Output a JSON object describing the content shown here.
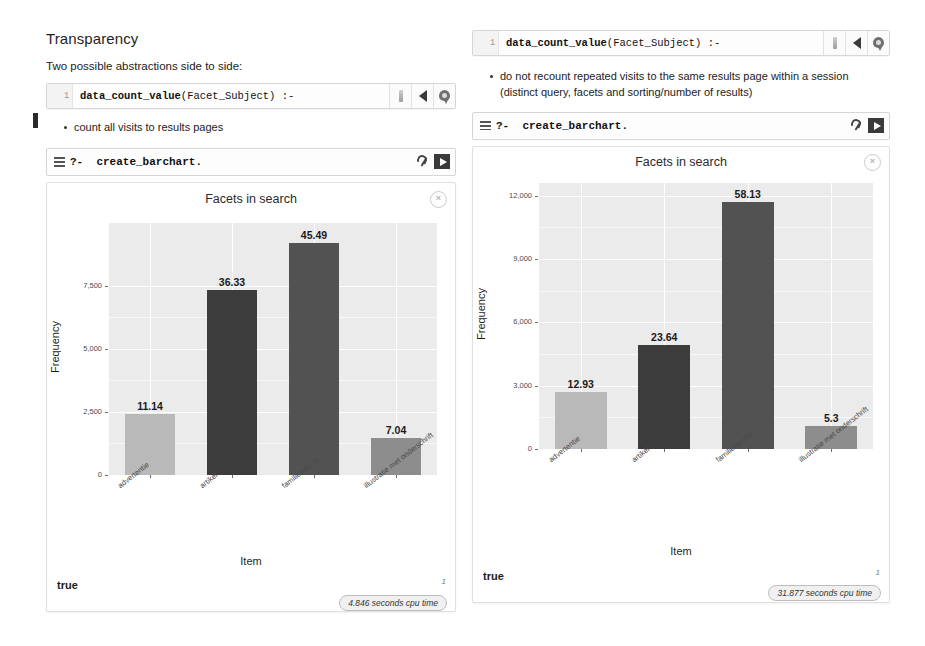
{
  "slide": {
    "title": "Transparency",
    "subtitle": "Two possible abstractions side to side:"
  },
  "left_panel": {
    "code_line_no": "1",
    "code_bold": "data_count_value",
    "code_rest": "(Facet_Subject) :-",
    "bullet": "count all visits to results pages",
    "query_prompt": "?-",
    "query_text": "create_barchart.",
    "close_label": "×",
    "result": "true",
    "page_number": "1",
    "cpu_badge": "4.846 seconds cpu time",
    "icons": {
      "slider": "slider-icon",
      "back": "triangle-left-icon",
      "pin": "location-pin-icon",
      "menu": "hamburger-icon",
      "wrench": "wrench-icon",
      "run": "play-icon"
    }
  },
  "right_panel": {
    "code_line_no": "1",
    "code_bold": "data_count_value",
    "code_rest": "(Facet_Subject) :-",
    "bullet": "do not recount repeated visits to the same results page within a session (distinct query, facets and sorting/number of results)",
    "query_prompt": "?-",
    "query_text": "create_barchart.",
    "close_label": "×",
    "result": "true",
    "page_number": "1",
    "cpu_badge": "31.877 seconds cpu time"
  },
  "chart_data": [
    {
      "id": "left",
      "type": "bar",
      "title": "Facets in search",
      "xlabel": "Item",
      "ylabel": "Frequency",
      "categories": [
        "advertentie",
        "artikel",
        "familiebericht",
        "illustratie met onderschrift"
      ],
      "values": [
        2400,
        7350,
        9200,
        1450
      ],
      "data_labels": [
        "11.14",
        "36.33",
        "45.49",
        "7.04"
      ],
      "bar_colors": [
        "#b9b9b9",
        "#3c3c3c",
        "#525252",
        "#8d8d8d"
      ],
      "yticks": [
        0,
        2500,
        5000,
        7500
      ],
      "ytick_labels": [
        "0",
        "2,500",
        "5,000",
        "7,500"
      ],
      "ylim": [
        0,
        10000
      ],
      "grid": true,
      "legend": "none"
    },
    {
      "id": "right",
      "type": "bar",
      "title": "Facets in search",
      "xlabel": "Item",
      "ylabel": "Frequency",
      "categories": [
        "advertentie",
        "artikel",
        "familiebericht",
        "illustratie met onderschrift"
      ],
      "values": [
        2700,
        4900,
        11700,
        1100
      ],
      "data_labels": [
        "12.93",
        "23.64",
        "58.13",
        "5.3"
      ],
      "bar_colors": [
        "#b9b9b9",
        "#3c3c3c",
        "#525252",
        "#8d8d8d"
      ],
      "yticks": [
        0,
        3000,
        6000,
        9000,
        12000
      ],
      "ytick_labels": [
        "0",
        "3,000",
        "6,000",
        "9,000",
        "12,000"
      ],
      "ylim": [
        0,
        12600
      ],
      "grid": true,
      "legend": "none"
    }
  ]
}
